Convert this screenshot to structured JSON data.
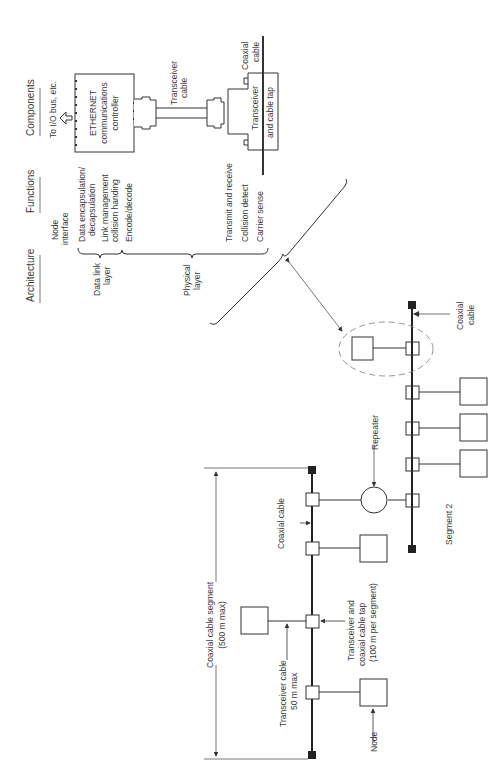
{
  "headers": {
    "architecture": "Architecture",
    "functions": "Functions",
    "components": "Components"
  },
  "architecture": {
    "data_link_layer": [
      "Data link",
      "layer"
    ],
    "physical_layer": [
      "Physical",
      "layer"
    ]
  },
  "functions": {
    "node_interface": [
      "Node",
      "interface"
    ],
    "data_encapsulation": [
      "Data encapsulation/",
      "decapsulation"
    ],
    "link_management": [
      "Link management",
      "collision handing"
    ],
    "encode_decode": "Encode/decode",
    "transmit_receive": "Transmit and receive",
    "collision_detect": "Collision detect",
    "carrier_sense": "Carrier sense"
  },
  "components": {
    "io_bus": "To I/O bus, etc.",
    "controller": [
      "ETHERNET",
      "communications",
      "controller"
    ],
    "transceiver_cable": [
      "Transceiver",
      "cable"
    ],
    "coaxial_cable": [
      "Coaxial",
      "cable"
    ],
    "transceiver_tap": [
      "Transceiver",
      "and cable tap"
    ]
  },
  "network": {
    "coaxial_cable_segment": [
      "Coaxial cable segment",
      "(500 m max)"
    ],
    "coaxial_cable": "Coaxial cable",
    "transceiver_cable": [
      "Transceiver cable",
      "50 m max"
    ],
    "transceiver_tap": [
      "Transceiver and",
      "coaxial cable tap",
      "(100 m per segment)"
    ],
    "node": "Node",
    "repeater": "Repeater",
    "segment2": "Segment 2",
    "segment2_coax": [
      "Coaxial",
      "cable"
    ]
  },
  "colors": {
    "line": "#333333",
    "dashed": "#888888",
    "text": "#3a3a3a"
  }
}
